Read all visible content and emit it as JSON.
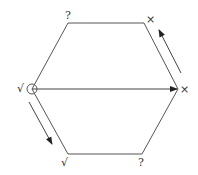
{
  "diagram": {
    "shape": "hexagon",
    "vertices": [
      {
        "id": "top-left",
        "x": 68,
        "y": 23,
        "label": "?"
      },
      {
        "id": "top-right",
        "x": 144,
        "y": 23,
        "label": "×"
      },
      {
        "id": "right",
        "x": 178,
        "y": 89,
        "label": "×"
      },
      {
        "id": "bottom-right",
        "x": 142,
        "y": 154,
        "label": "?"
      },
      {
        "id": "bottom-left",
        "x": 68,
        "y": 154,
        "label": "√"
      },
      {
        "id": "left",
        "x": 32,
        "y": 89,
        "label": "√"
      }
    ],
    "arrows": [
      {
        "id": "horizontal",
        "from": "left",
        "to": "right"
      },
      {
        "id": "upper-right-edge",
        "direction": "right to top-right"
      },
      {
        "id": "lower-left-edge",
        "direction": "left to bottom-left"
      }
    ],
    "start_marker": "circle at left vertex",
    "colors": {
      "stroke": "#555555",
      "text": "#333333"
    }
  }
}
